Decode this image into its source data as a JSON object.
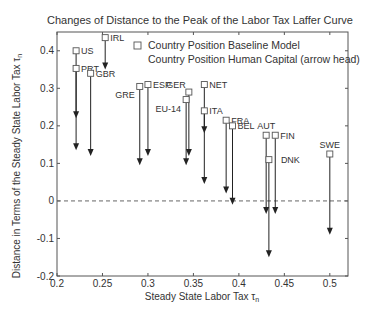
{
  "chart_data": {
    "type": "scatter",
    "title": "Changes of Distance to the Peak of the Labor Tax Laffer Curve",
    "xlabel": "Steady State Labor Tax τ",
    "xlabel_sub": "n",
    "ylabel": "Distance in Terms of the Steady State Labor Tax τ",
    "ylabel_sub": "n",
    "xlim": [
      0.2,
      0.52
    ],
    "ylim": [
      -0.2,
      0.45
    ],
    "xticks": [
      0.2,
      0.25,
      0.3,
      0.35,
      0.4,
      0.45,
      0.5
    ],
    "xtick_labels": [
      "0.2",
      "0.25",
      "0.3",
      "0.35",
      "0.4",
      "0.45",
      "0.5"
    ],
    "yticks": [
      -0.2,
      -0.1,
      0,
      0.1,
      0.2,
      0.3,
      0.4
    ],
    "ytick_labels": [
      "-0.2",
      "-0.1",
      "0",
      "0.1",
      "0.2",
      "0.3",
      "0.4"
    ],
    "grid": false,
    "reference_line": {
      "y": 0,
      "style": "dashed"
    },
    "legend": {
      "position": "top-right",
      "entries": [
        {
          "marker": "square",
          "label": "Country Position Baseline Model"
        },
        {
          "marker": "arrow",
          "label": "Country Position Human Capital (arrow head)"
        }
      ]
    },
    "series": [
      {
        "name": "Country Position Baseline Model",
        "marker": "square"
      },
      {
        "name": "Country Position Human Capital (arrow head)",
        "marker": "arrow"
      }
    ],
    "points": [
      {
        "country": "US",
        "x": 0.221,
        "baseline": 0.4,
        "human_capital": 0.22,
        "label_pos": "right"
      },
      {
        "country": "IRL",
        "x": 0.253,
        "baseline": 0.435,
        "human_capital": 0.35,
        "label_pos": "right"
      },
      {
        "country": "PRT",
        "x": 0.221,
        "baseline": 0.353,
        "human_capital": 0.135,
        "label_pos": "right"
      },
      {
        "country": "GBR",
        "x": 0.237,
        "baseline": 0.34,
        "human_capital": 0.12,
        "label_pos": "right"
      },
      {
        "country": "GRE",
        "x": 0.291,
        "baseline": 0.305,
        "human_capital": 0.095,
        "label_pos": "left-below"
      },
      {
        "country": "ESP",
        "x": 0.3,
        "baseline": 0.31,
        "human_capital": 0.12,
        "label_pos": "right"
      },
      {
        "country": "GER",
        "x": 0.345,
        "baseline": 0.29,
        "human_capital": 0.12,
        "label_pos": "left-above"
      },
      {
        "country": "EU-14",
        "x": 0.342,
        "baseline": 0.27,
        "human_capital": 0.095,
        "label_pos": "left-below"
      },
      {
        "country": "NET",
        "x": 0.362,
        "baseline": 0.31,
        "human_capital": 0.045,
        "label_pos": "right"
      },
      {
        "country": "ITA",
        "x": 0.362,
        "baseline": 0.24,
        "human_capital": 0.18,
        "label_pos": "right"
      },
      {
        "country": "FRA",
        "x": 0.386,
        "baseline": 0.215,
        "human_capital": 0.02,
        "label_pos": "right"
      },
      {
        "country": "BEL",
        "x": 0.393,
        "baseline": 0.2,
        "human_capital": -0.01,
        "label_pos": "right"
      },
      {
        "country": "AUT",
        "x": 0.43,
        "baseline": 0.175,
        "human_capital": -0.035,
        "label_pos": "above"
      },
      {
        "country": "FIN",
        "x": 0.44,
        "baseline": 0.175,
        "human_capital": -0.035,
        "label_pos": "right"
      },
      {
        "country": "DNK",
        "x": 0.433,
        "baseline": 0.11,
        "human_capital": -0.15,
        "label_pos": "right-far"
      },
      {
        "country": "SWE",
        "x": 0.5,
        "baseline": 0.125,
        "human_capital": -0.09,
        "label_pos": "above"
      }
    ]
  },
  "colors": {
    "axis": "#555555",
    "text": "#333333",
    "arrow": "#222222",
    "marker": "#555555",
    "dashed": "#666666"
  }
}
